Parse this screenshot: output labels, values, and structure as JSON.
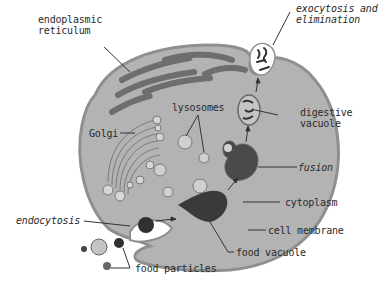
{
  "diagram": {
    "colors": {
      "background": "#ffffff",
      "cytoplasm": "#b3b3b3",
      "membrane": "#8f8f8f",
      "er": "#6e6e6e",
      "golgi": "#d6d6d6",
      "vesicle": "#cfcfcf",
      "food_vacuole": "#3a3a3a",
      "dark_particle": "#303030",
      "text": "#2a2a2a"
    },
    "labels": {
      "endoplasmic_reticulum_line1": "endoplasmic",
      "endoplasmic_reticulum_line2": "reticulum",
      "golgi": "Golgi",
      "lysosomes": "lysosomes",
      "exocytosis_line1": "exocytosis and",
      "exocytosis_line2": "elimination",
      "digestive_vacuole_line1": "digestive",
      "digestive_vacuole_line2": "vacuole",
      "fusion": "fusion",
      "cytoplasm": "cytoplasm",
      "cell_membrane": "cell membrane",
      "endocytosis": "endocytosis",
      "food_vacuole": "food vacuole",
      "food_particles": "food particles"
    }
  }
}
